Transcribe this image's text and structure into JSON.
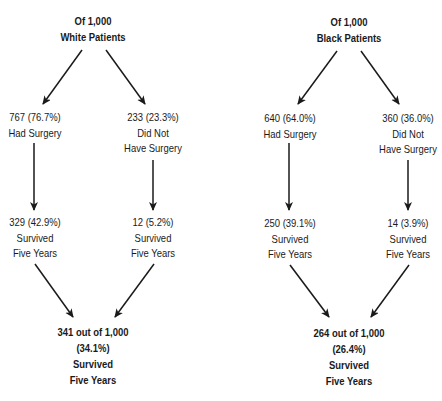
{
  "figure": {
    "type": "flow-diagram"
  },
  "diagrams": [
    {
      "id": "white",
      "root": {
        "line1": "Of 1,000",
        "line2": "White Patients"
      },
      "surgery": {
        "line1": "767 (76.7%)",
        "line2": "Had Surgery"
      },
      "no_surgery": {
        "line1": "233 (23.3%)",
        "line2": "Did Not",
        "line3": "Have Surgery"
      },
      "surgery_survived": {
        "line1": "329 (42.9%)",
        "line2": "Survived",
        "line3": "Five Years"
      },
      "no_surgery_survived": {
        "line1": "12 (5.2%)",
        "line2": "Survived",
        "line3": "Five Years"
      },
      "total": {
        "line1": "341 out of 1,000",
        "line2": "(34.1%)",
        "line3": "Survived",
        "line4": "Five Years"
      }
    },
    {
      "id": "black",
      "root": {
        "line1": "Of 1,000",
        "line2": "Black Patients"
      },
      "surgery": {
        "line1": "640 (64.0%)",
        "line2": "Had Surgery"
      },
      "no_surgery": {
        "line1": "360 (36.0%)",
        "line2": "Did Not",
        "line3": "Have Surgery"
      },
      "surgery_survived": {
        "line1": "250 (39.1%)",
        "line2": "Survived",
        "line3": "Five Years"
      },
      "no_surgery_survived": {
        "line1": "14 (3.9%)",
        "line2": "Survived",
        "line3": "Five Years"
      },
      "total": {
        "line1": "264 out of 1,000",
        "line2": "(26.4%)",
        "line3": "Survived",
        "line4": "Five Years"
      }
    }
  ],
  "colors": {
    "text": "#1a1a1a",
    "arrow": "#1a1a1a",
    "background": "#ffffff"
  }
}
